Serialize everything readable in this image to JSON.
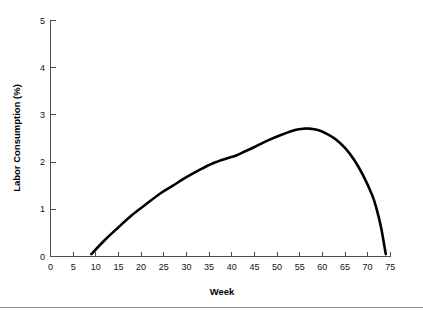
{
  "chart_data": {
    "type": "line",
    "title": "",
    "subtitle": "",
    "xlabel": "Week",
    "ylabel": "Labor Consumption (%)",
    "xlim": [
      0,
      75
    ],
    "ylim": [
      0,
      5
    ],
    "xticks": [
      0,
      5,
      10,
      15,
      20,
      25,
      30,
      35,
      40,
      45,
      50,
      55,
      60,
      65,
      70,
      75
    ],
    "xtick_labels": [
      "0",
      "5",
      "10",
      "15",
      "20",
      "25",
      "30",
      "35",
      "40",
      "45",
      "50",
      "55",
      "60",
      "65",
      "70",
      "75"
    ],
    "yticks": [
      0,
      1,
      2,
      3,
      4,
      5
    ],
    "ytick_labels": [
      "0",
      "1",
      "2",
      "3",
      "4",
      "5"
    ],
    "grid": false,
    "legend": null,
    "legend_position": "none",
    "series": [
      {
        "name": "Labor Consumption",
        "color": "#000000",
        "line_width": 2.6,
        "x": [
          9,
          12,
          15,
          18,
          21,
          24,
          27,
          30,
          33,
          36,
          39,
          41,
          43,
          45,
          48,
          51,
          54,
          56,
          57,
          59,
          61,
          63,
          65,
          67,
          69,
          71,
          72,
          73,
          74
        ],
        "values": [
          0.05,
          0.35,
          0.62,
          0.88,
          1.1,
          1.32,
          1.5,
          1.68,
          1.84,
          1.98,
          2.08,
          2.14,
          2.23,
          2.32,
          2.46,
          2.58,
          2.68,
          2.71,
          2.71,
          2.68,
          2.6,
          2.48,
          2.3,
          2.05,
          1.72,
          1.3,
          1.0,
          0.6,
          0.05
        ]
      }
    ],
    "peak": {
      "week": 56.5,
      "value": 2.71
    },
    "start": {
      "week": 9,
      "value": 0
    },
    "end": {
      "week": 74,
      "value": 0
    }
  },
  "axes": {
    "x_axis_title": "Week",
    "y_axis_title": "Labor Consumption (%)",
    "axis_color": "#4d4d4d"
  },
  "footer": {
    "rule_color": "#8c8c8c"
  }
}
